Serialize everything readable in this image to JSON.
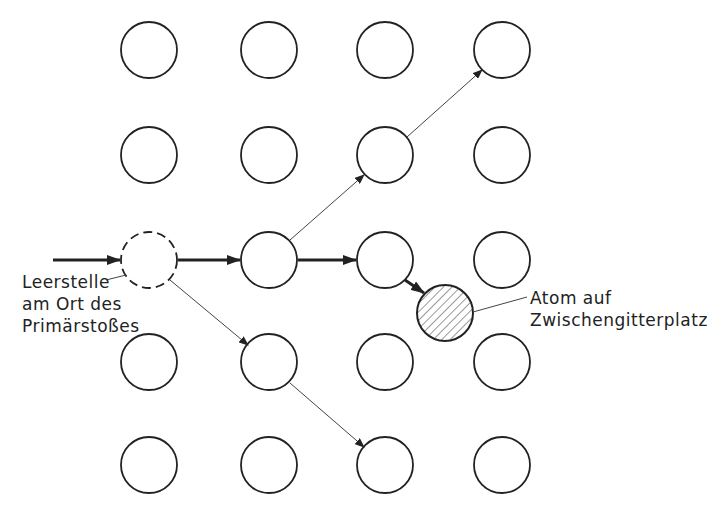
{
  "diagram": {
    "title": "",
    "labels": {
      "vacancy": [
        "Leerstelle",
        "am Ort des",
        "Primärstoßes"
      ],
      "interstitial": [
        "Atom auf",
        "Zwischengitterplatz"
      ]
    },
    "grid": {
      "columns_x": [
        149,
        269,
        385,
        502
      ],
      "rows_y": [
        50,
        155,
        260,
        362,
        465
      ],
      "radius": 28
    },
    "colors": {
      "stroke": "#222222",
      "background": "#ffffff"
    }
  }
}
